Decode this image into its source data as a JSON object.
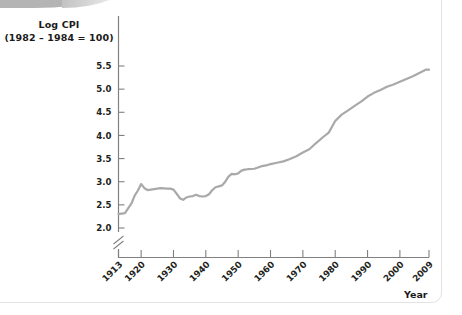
{
  "page": {
    "background_color": "#ffffff",
    "panel_border_color": "#e3e3e3",
    "decor_color": "#b4b4b4"
  },
  "chart_data": {
    "type": "line",
    "title": "Log CPI",
    "subtitle": "(1982 – 1984 = 100)",
    "xlabel": "Year",
    "ylabel": "Log CPI (1982 – 1984 = 100)",
    "line_color": "#a9a9a9",
    "line_width": 2.2,
    "grid": false,
    "legend": "none",
    "axis_break_y": true,
    "ylim": [
      2.0,
      5.5
    ],
    "yticks": [
      "2.0",
      "2.5",
      "3.0",
      "3.5",
      "4.0",
      "4.5",
      "5.0",
      "5.5"
    ],
    "ytick_values": [
      2.0,
      2.5,
      3.0,
      3.5,
      4.0,
      4.5,
      5.0,
      5.5
    ],
    "xlim": [
      1913,
      2009
    ],
    "xticks": [
      "1913",
      "1920",
      "1930",
      "1940",
      "1950",
      "1960",
      "1970",
      "1980",
      "1990",
      "2000",
      "2009"
    ],
    "xtick_values": [
      1913,
      1920,
      1930,
      1940,
      1950,
      1960,
      1970,
      1980,
      1990,
      2000,
      2009
    ],
    "xtick_rotation_deg": 45,
    "x": [
      1913,
      1915,
      1917,
      1918,
      1919,
      1920,
      1921,
      1922,
      1924,
      1926,
      1928,
      1929,
      1930,
      1931,
      1932,
      1933,
      1934,
      1935,
      1936,
      1937,
      1938,
      1939,
      1940,
      1941,
      1942,
      1943,
      1944,
      1945,
      1946,
      1947,
      1948,
      1949,
      1950,
      1951,
      1952,
      1953,
      1955,
      1957,
      1959,
      1960,
      1962,
      1964,
      1966,
      1968,
      1970,
      1972,
      1974,
      1976,
      1978,
      1980,
      1982,
      1984,
      1986,
      1988,
      1990,
      1992,
      1994,
      1996,
      1998,
      2000,
      2002,
      2004,
      2006,
      2008,
      2009
    ],
    "y": [
      2.3,
      2.32,
      2.53,
      2.7,
      2.81,
      2.95,
      2.86,
      2.82,
      2.84,
      2.86,
      2.85,
      2.85,
      2.83,
      2.74,
      2.64,
      2.61,
      2.66,
      2.68,
      2.69,
      2.72,
      2.69,
      2.68,
      2.69,
      2.73,
      2.82,
      2.88,
      2.9,
      2.92,
      3.0,
      3.11,
      3.17,
      3.16,
      3.18,
      3.24,
      3.26,
      3.27,
      3.28,
      3.33,
      3.36,
      3.38,
      3.41,
      3.44,
      3.49,
      3.55,
      3.63,
      3.7,
      3.83,
      3.95,
      4.06,
      4.31,
      4.45,
      4.54,
      4.64,
      4.73,
      4.84,
      4.92,
      4.98,
      5.05,
      5.1,
      5.16,
      5.22,
      5.28,
      5.35,
      5.42,
      5.42
    ],
    "annotations": []
  }
}
